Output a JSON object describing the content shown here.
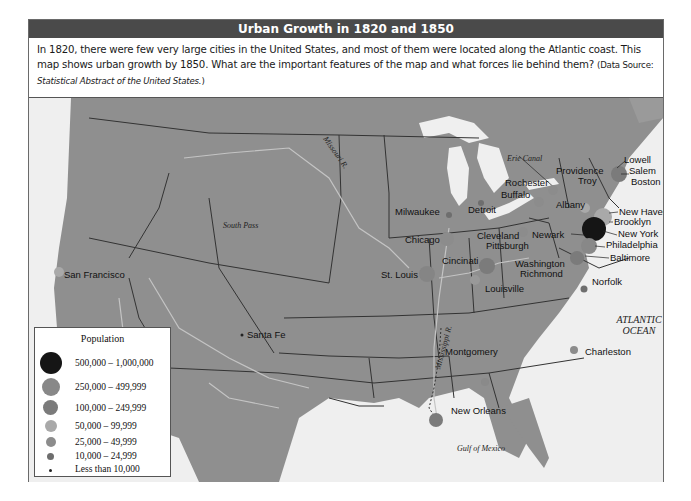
{
  "title": "Urban Growth in 1820 and 1850",
  "description": {
    "text": "In 1820, there were few very large cities in the United States, and most of them were located along the Atlantic coast.  This map shows urban growth by 1850. What are the important features of the map and what forces lie behind them?",
    "source_prefix": "(Data Source: ",
    "source_title": "Statistical Abstract of the United States.",
    "source_suffix": ")"
  },
  "colors": {
    "title_bar": "#4a4a4a",
    "land": "#8f8f8f",
    "water": "#efefef",
    "border": "#333333",
    "river": "#c4c4c4"
  },
  "legend": {
    "title": "Population",
    "items": [
      {
        "label": "500,000 – 1,000,000",
        "color": "#151515",
        "size": 22
      },
      {
        "label": "250,000 – 499,999",
        "color": "#888888",
        "size": 18
      },
      {
        "label": "100,000 – 249,999",
        "color": "#7b7b7b",
        "size": 15
      },
      {
        "label": "50,000 – 99,999",
        "color": "#a9a9a9",
        "size": 12
      },
      {
        "label": "25,000 – 49,999",
        "color": "#8c8c8c",
        "size": 10
      },
      {
        "label": "10,000 – 24,999",
        "color": "#6e6e6e",
        "size": 7
      },
      {
        "label": "Less than 10,000",
        "color": "#222222",
        "size": 3
      }
    ]
  },
  "cities": [
    {
      "name": "San Francisco",
      "class": "50,000 – 99,999"
    },
    {
      "name": "Santa Fe",
      "class": "Less than 10,000"
    },
    {
      "name": "Milwaukee",
      "class": "10,000 – 24,999"
    },
    {
      "name": "Chicago",
      "class": "25,000 – 49,999"
    },
    {
      "name": "St. Louis",
      "class": "50,000 – 99,999"
    },
    {
      "name": "Detroit",
      "class": "10,000 – 24,999"
    },
    {
      "name": "Cleveland",
      "class": "10,000 – 24,999"
    },
    {
      "name": "Cincinati",
      "class": "100,000 – 249,999"
    },
    {
      "name": "Louisville",
      "class": "25,000 – 49,999"
    },
    {
      "name": "Pittsburgh",
      "class": "25,000 – 49,999"
    },
    {
      "name": "Rochester",
      "class": "25,000 – 49,999"
    },
    {
      "name": "Buffalo",
      "class": "25,000 – 49,999"
    },
    {
      "name": "Albany",
      "class": "50,000 – 99,999"
    },
    {
      "name": "Troy",
      "class": "25,000 – 49,999"
    },
    {
      "name": "Providence",
      "class": "25,000 – 49,999"
    },
    {
      "name": "Lowell",
      "class": "25,000 – 49,999"
    },
    {
      "name": "Salem",
      "class": "10,000 – 24,999"
    },
    {
      "name": "Boston",
      "class": "100,000 – 249,999"
    },
    {
      "name": "New Haven",
      "class": "10,000 – 24,999"
    },
    {
      "name": "Newark",
      "class": "25,000 – 49,999"
    },
    {
      "name": "Brooklyn",
      "class": "50,000 – 99,999"
    },
    {
      "name": "New York",
      "class": "500,000 – 1,000,000"
    },
    {
      "name": "Philadelphia",
      "class": "250,000 – 499,999"
    },
    {
      "name": "Baltimore",
      "class": "100,000 – 249,999"
    },
    {
      "name": "Washington",
      "class": "25,000 – 49,999"
    },
    {
      "name": "Richmond",
      "class": "25,000 – 49,999"
    },
    {
      "name": "Norfolk",
      "class": "10,000 – 24,999"
    },
    {
      "name": "Charleston",
      "class": "25,000 – 49,999"
    },
    {
      "name": "Montgomery",
      "class": "10,000 – 24,999"
    },
    {
      "name": "New Orleans",
      "class": "100,000 – 249,999"
    }
  ],
  "geo_labels": {
    "erie_canal": "Erie Canal",
    "missouri": "Missouri R.",
    "mississippi": "Mississippi R.",
    "south_pass": "South Pass",
    "atlantic_1": "ATLANTIC",
    "atlantic_2": "OCEAN",
    "gulf": "Gulf of Mexico"
  }
}
